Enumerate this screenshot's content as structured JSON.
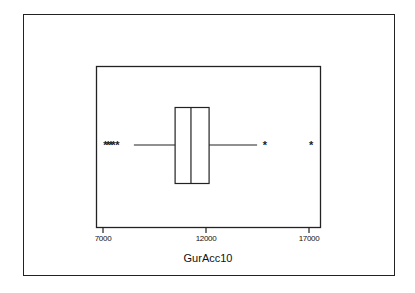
{
  "chart_data": {
    "type": "boxplot",
    "title": "",
    "xlabel": "GurAcc10",
    "ylabel": "",
    "orientation": "horizontal",
    "xlim": [
      6650,
      17550
    ],
    "xticks": [
      7000,
      12000,
      17000
    ],
    "xtick_labels": [
      "7000",
      "12000",
      "17000"
    ],
    "grid": false,
    "legend": null,
    "series": [
      {
        "name": "GurAcc10",
        "whisker_low": 8500,
        "q1": 10500,
        "median": 11270,
        "q3": 12150,
        "whisker_high": 14480,
        "outliers": [
          7120,
          7250,
          7380,
          7500,
          7700,
          14860,
          17100
        ],
        "outlier_marker": "*"
      }
    ]
  },
  "axis": {
    "ticks": [
      {
        "label": "7000",
        "value": 7000
      },
      {
        "label": "12000",
        "value": 12000
      },
      {
        "label": "17000",
        "value": 17000
      }
    ],
    "xlabel": "GurAcc10"
  },
  "colors": {
    "stroke": "#222222",
    "background": "#ffffff"
  }
}
